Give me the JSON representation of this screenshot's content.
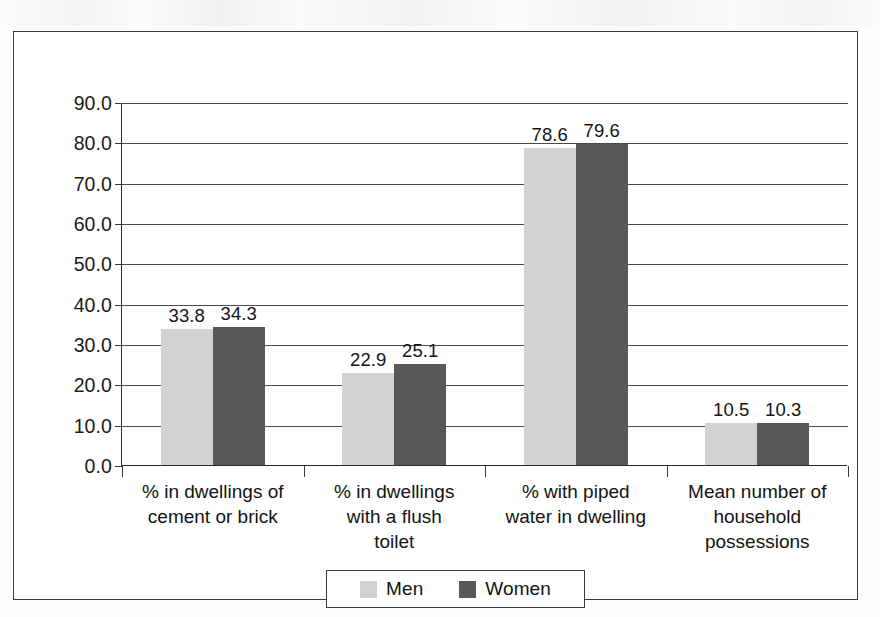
{
  "chart_data": {
    "type": "bar",
    "title": "",
    "xlabel": "",
    "ylabel": "",
    "ylim": [
      0,
      90
    ],
    "ytick_step": 10,
    "grid": true,
    "legend_position": "bottom",
    "categories": [
      "% in dwellings of\ncement or brick",
      "% in dwellings\nwith a flush\ntoilet",
      "% with piped\nwater in dwelling",
      "Mean number of\nhousehold\npossessions"
    ],
    "ytick_labels": [
      "0.0",
      "10.0",
      "20.0",
      "30.0",
      "40.0",
      "50.0",
      "60.0",
      "70.0",
      "80.0",
      "90.0"
    ],
    "ytick_values": [
      0,
      10,
      20,
      30,
      40,
      50,
      60,
      70,
      80,
      90
    ],
    "series": [
      {
        "name": "Men",
        "color": "#d2d2d2",
        "values": [
          33.8,
          22.9,
          78.6,
          10.5
        ],
        "labels": [
          "33.8",
          "22.9",
          "78.6",
          "10.5"
        ]
      },
      {
        "name": "Women",
        "color": "#585858",
        "values": [
          34.3,
          25.1,
          79.6,
          10.3
        ],
        "labels": [
          "34.3",
          "25.1",
          "79.6",
          "10.3"
        ]
      }
    ]
  },
  "legend": {
    "items": [
      {
        "label": "Men",
        "color": "#d2d2d2"
      },
      {
        "label": "Women",
        "color": "#585858"
      }
    ]
  },
  "colors": {
    "men_bar": "#d2d2d2",
    "women_bar": "#585858",
    "axis": "#2b2b2b",
    "gridline": "#4a4a4a",
    "frame": "#3a3a3a",
    "text": "#131313",
    "background": "#ffffff"
  }
}
